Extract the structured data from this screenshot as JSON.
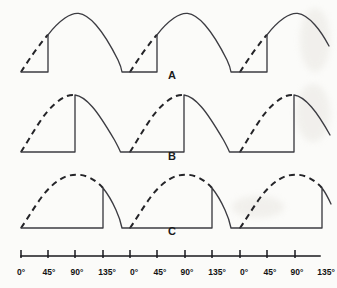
{
  "figure": {
    "background_color": "#fbfbf9",
    "solid_color": "#3c3c42",
    "dashed_color": "#242428",
    "axis_color": "#19191c"
  },
  "axis": {
    "name": "degrees-axis",
    "unit": "degrees",
    "x_start_px": 21,
    "x_end_px": 320,
    "degrees_per_pixel": 1.6363,
    "tick_labels": [
      "0°",
      "45°",
      "90°",
      "135°",
      "0°",
      "45°",
      "90°",
      "135°",
      "0°",
      "45°",
      "90°",
      "135°"
    ],
    "tick_positions_px": [
      21,
      48,
      75,
      103,
      130,
      157,
      185,
      212,
      240,
      267,
      295
    ],
    "cycle_width_px": 109.5,
    "cycles_shown": 3
  },
  "waveforms": [
    {
      "id": "A",
      "label": "A",
      "label_x": 172,
      "label_y": 79,
      "firing_angle_deg": 45,
      "conduction_angle_deg": 135,
      "baseline_y_px": 72,
      "peak_y_px": 13,
      "description": "Thyristor fires at 45 degrees; dashed portion is the blocked (non-conducting) part of the supply sine, solid portion is the conducting output."
    },
    {
      "id": "B",
      "label": "B",
      "label_x": 172,
      "label_y": 159,
      "firing_angle_deg": 90,
      "conduction_angle_deg": 90,
      "baseline_y_px": 152,
      "peak_y_px": 95,
      "description": "Thyristor fires at 90 degrees (at the peak of the sine); output conducts from 90 to 180 degrees."
    },
    {
      "id": "C",
      "label": "C",
      "label_x": 172,
      "label_y": 234,
      "firing_angle_deg": 135,
      "conduction_angle_deg": 45,
      "baseline_y_px": 228,
      "peak_y_px": 175,
      "description": "Thyristor fires at 135 degrees; only the last 45 degrees of each half cycle is conducted."
    }
  ],
  "legend_meaning": {
    "dashed": "blocked portion of supply sine wave",
    "solid": "conducted output voltage"
  }
}
